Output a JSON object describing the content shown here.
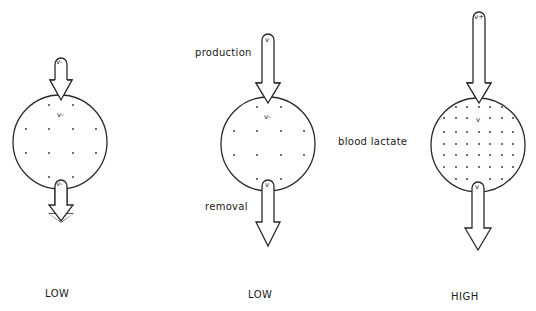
{
  "labels": {
    "production": "production",
    "removal": "removal",
    "blood_lactate": "blood lactate"
  },
  "panels": [
    {
      "id": "left",
      "level": "LOW",
      "in_arrow_label": "v-",
      "center_label": "v-",
      "out_arrow_label": "v-",
      "dot_density": "sparse"
    },
    {
      "id": "middle",
      "level": "LOW",
      "in_arrow_label": "v",
      "center_label": "v-",
      "out_arrow_label": "v",
      "dot_density": "sparse"
    },
    {
      "id": "right",
      "level": "HIGH",
      "in_arrow_label": "v+",
      "center_label": "v",
      "out_arrow_label": "v",
      "dot_density": "dense"
    }
  ],
  "colors": {
    "stroke": "#2a2a2a",
    "text": "#1a1a1a",
    "background": "#ffffff"
  }
}
